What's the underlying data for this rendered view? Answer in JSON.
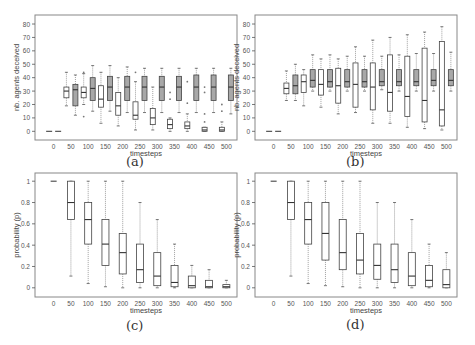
{
  "figure": {
    "panel_labels": [
      "(a)",
      "(b)",
      "(c)",
      "(d)"
    ]
  },
  "chart_data": [
    {
      "id": "a",
      "type": "boxplot",
      "panel_label": "(a)",
      "title": "",
      "xlabel": "timesteps",
      "ylabel": "nb. agents deceived",
      "categories": [
        "0",
        "50",
        "100",
        "150",
        "200",
        "250",
        "300",
        "350",
        "400",
        "450",
        "500"
      ],
      "yticks": [
        0,
        10,
        20,
        30,
        40,
        50,
        60,
        70,
        80
      ],
      "ytick_labels": [
        "0",
        "10",
        "20",
        "30",
        "40",
        "50",
        "60",
        "70",
        "80"
      ],
      "ylim": [
        -2,
        83
      ],
      "grid": false,
      "series": [
        {
          "name": "white",
          "fill": "#ffffff",
          "boxes": [
            {
              "min": 0,
              "q1": 0,
              "median": 0,
              "q3": 0,
              "max": 0,
              "outliers": []
            },
            {
              "min": 19,
              "q1": 25,
              "median": 30,
              "q3": 33,
              "max": 44,
              "outliers": []
            },
            {
              "min": 20,
              "q1": 25,
              "median": 29,
              "q3": 33,
              "max": 43,
              "outliers": [
                11,
                44
              ]
            },
            {
              "min": 6,
              "q1": 18,
              "median": 24,
              "q3": 34,
              "max": 44,
              "outliers": []
            },
            {
              "min": 4,
              "q1": 12,
              "median": 19,
              "q3": 29,
              "max": 40,
              "outliers": []
            },
            {
              "min": 1,
              "q1": 9,
              "median": 12,
              "q3": 22,
              "max": 37,
              "outliers": [
                44
              ]
            },
            {
              "min": 1,
              "q1": 5,
              "median": 10,
              "q3": 17,
              "max": 33,
              "outliers": []
            },
            {
              "min": 0,
              "q1": 2,
              "median": 5,
              "q3": 9,
              "max": 10,
              "outliers": [
                24,
                29
              ]
            },
            {
              "min": 0,
              "q1": 2,
              "median": 4,
              "q3": 7,
              "max": 13,
              "outliers": [
                21,
                37
              ]
            },
            {
              "min": 0,
              "q1": 0,
              "median": 1,
              "q3": 3,
              "max": 3,
              "outliers": [
                7,
                13,
                29,
                33
              ]
            },
            {
              "min": 0,
              "q1": 0,
              "median": 1,
              "q3": 3,
              "max": 7,
              "outliers": [
                15,
                20
              ]
            }
          ]
        },
        {
          "name": "grey",
          "fill": "#a8a8a8",
          "boxes": [
            {
              "min": 0,
              "q1": 0,
              "median": 0,
              "q3": 0,
              "max": 0,
              "outliers": []
            },
            {
              "min": 12,
              "q1": 19,
              "median": 31,
              "q3": 35,
              "max": 42,
              "outliers": []
            },
            {
              "min": 15,
              "q1": 23,
              "median": 32,
              "q3": 40,
              "max": 49,
              "outliers": []
            },
            {
              "min": 15,
              "q1": 23,
              "median": 33,
              "q3": 41,
              "max": 49,
              "outliers": []
            },
            {
              "min": 14,
              "q1": 23,
              "median": 33,
              "q3": 41,
              "max": 48,
              "outliers": []
            },
            {
              "min": 14,
              "q1": 23,
              "median": 33,
              "q3": 41,
              "max": 47,
              "outliers": []
            },
            {
              "min": 14,
              "q1": 23,
              "median": 33,
              "q3": 41,
              "max": 47,
              "outliers": []
            },
            {
              "min": 14,
              "q1": 23,
              "median": 33,
              "q3": 41,
              "max": 47,
              "outliers": []
            },
            {
              "min": 14,
              "q1": 23,
              "median": 33,
              "q3": 42,
              "max": 47,
              "outliers": []
            },
            {
              "min": 14,
              "q1": 23,
              "median": 33,
              "q3": 42,
              "max": 47,
              "outliers": []
            },
            {
              "min": 13,
              "q1": 23,
              "median": 33,
              "q3": 42,
              "max": 47,
              "outliers": []
            }
          ]
        }
      ],
      "frame": {
        "x0": 35,
        "y0": 15,
        "x1": 237,
        "y1": 140
      }
    },
    {
      "id": "b",
      "type": "boxplot",
      "panel_label": "(b)",
      "title": "",
      "xlabel": "timesteps",
      "ylabel": "nb. agents deceived",
      "categories": [
        "0",
        "50",
        "100",
        "150",
        "200",
        "250",
        "300",
        "350",
        "400",
        "450",
        "500"
      ],
      "yticks": [
        0,
        10,
        20,
        30,
        40,
        50,
        60,
        70,
        80
      ],
      "ytick_labels": [
        "0",
        "10",
        "20",
        "30",
        "40",
        "50",
        "60",
        "70",
        "80"
      ],
      "ylim": [
        -2,
        83
      ],
      "grid": false,
      "series": [
        {
          "name": "white",
          "fill": "#ffffff",
          "boxes": [
            {
              "min": 0,
              "q1": 0,
              "median": 0,
              "q3": 0,
              "max": 0,
              "outliers": []
            },
            {
              "min": 23,
              "q1": 28,
              "median": 32,
              "q3": 36,
              "max": 45,
              "outliers": []
            },
            {
              "min": 19,
              "q1": 29,
              "median": 37,
              "q3": 42,
              "max": 46,
              "outliers": []
            },
            {
              "min": 18,
              "q1": 27,
              "median": 35,
              "q3": 46,
              "max": 54,
              "outliers": []
            },
            {
              "min": 13,
              "q1": 21,
              "median": 34,
              "q3": 47,
              "max": 54,
              "outliers": []
            },
            {
              "min": 14,
              "q1": 18,
              "median": 35,
              "q3": 51,
              "max": 63,
              "outliers": []
            },
            {
              "min": 6,
              "q1": 16,
              "median": 33,
              "q3": 51,
              "max": 68,
              "outliers": []
            },
            {
              "min": 6,
              "q1": 15,
              "median": 29,
              "q3": 57,
              "max": 70,
              "outliers": []
            },
            {
              "min": 3,
              "q1": 11,
              "median": 26,
              "q3": 56,
              "max": 72,
              "outliers": []
            },
            {
              "min": 2,
              "q1": 7,
              "median": 23,
              "q3": 62,
              "max": 74,
              "outliers": []
            },
            {
              "min": 1,
              "q1": 4,
              "median": 16,
              "q3": 67,
              "max": 78,
              "outliers": []
            }
          ]
        },
        {
          "name": "grey",
          "fill": "#a8a8a8",
          "boxes": [
            {
              "min": 0,
              "q1": 0,
              "median": 0,
              "q3": 0,
              "max": 0,
              "outliers": []
            },
            {
              "min": 23,
              "q1": 28,
              "median": 34,
              "q3": 42,
              "max": 50,
              "outliers": []
            },
            {
              "min": 30,
              "q1": 33,
              "median": 38,
              "q3": 46,
              "max": 57,
              "outliers": []
            },
            {
              "min": 30,
              "q1": 33,
              "median": 37,
              "q3": 46,
              "max": 57,
              "outliers": []
            },
            {
              "min": 30,
              "q1": 33,
              "median": 37,
              "q3": 46,
              "max": 56,
              "outliers": []
            },
            {
              "min": 30,
              "q1": 33,
              "median": 37,
              "q3": 46,
              "max": 56,
              "outliers": []
            },
            {
              "min": 31,
              "q1": 34,
              "median": 37,
              "q3": 46,
              "max": 56,
              "outliers": []
            },
            {
              "min": 30,
              "q1": 34,
              "median": 37,
              "q3": 46,
              "max": 57,
              "outliers": []
            },
            {
              "min": 30,
              "q1": 34,
              "median": 37,
              "q3": 46,
              "max": 58,
              "outliers": []
            },
            {
              "min": 30,
              "q1": 34,
              "median": 38,
              "q3": 46,
              "max": 58,
              "outliers": []
            },
            {
              "min": 30,
              "q1": 34,
              "median": 38,
              "q3": 46,
              "max": 59,
              "outliers": []
            }
          ]
        }
      ],
      "frame": {
        "x0": 255,
        "y0": 15,
        "x1": 457,
        "y1": 140
      }
    },
    {
      "id": "c",
      "type": "boxplot",
      "panel_label": "(c)",
      "title": "",
      "xlabel": "timesteps",
      "ylabel": "probability (p)",
      "categories": [
        "0",
        "50",
        "100",
        "150",
        "200",
        "250",
        "300",
        "350",
        "400",
        "450",
        "500"
      ],
      "yticks": [
        0,
        0.2,
        0.4,
        0.6,
        0.8,
        1
      ],
      "ytick_labels": [
        "0",
        "0.2",
        "0.4",
        "0.6",
        "0.8",
        "1"
      ],
      "ylim": [
        -0.03,
        1.03
      ],
      "grid": false,
      "series": [
        {
          "name": "white",
          "fill": "#ffffff",
          "boxes": [
            {
              "min": 1,
              "q1": 1,
              "median": 1,
              "q3": 1,
              "max": 1,
              "outliers": []
            },
            {
              "min": 0.11,
              "q1": 0.64,
              "median": 0.8,
              "q3": 1,
              "max": 1,
              "outliers": []
            },
            {
              "min": 0.04,
              "q1": 0.41,
              "median": 0.64,
              "q3": 0.8,
              "max": 1,
              "outliers": []
            },
            {
              "min": 0.01,
              "q1": 0.21,
              "median": 0.41,
              "q3": 0.64,
              "max": 1,
              "outliers": []
            },
            {
              "min": 0,
              "q1": 0.13,
              "median": 0.33,
              "q3": 0.51,
              "max": 1,
              "outliers": []
            },
            {
              "min": 0,
              "q1": 0.05,
              "median": 0.17,
              "q3": 0.41,
              "max": 0.8,
              "outliers": []
            },
            {
              "min": 0,
              "q1": 0.02,
              "median": 0.11,
              "q3": 0.33,
              "max": 0.64,
              "outliers": []
            },
            {
              "min": 0,
              "q1": 0.01,
              "median": 0.05,
              "q3": 0.21,
              "max": 0.41,
              "outliers": []
            },
            {
              "min": 0,
              "q1": 0,
              "median": 0.02,
              "q3": 0.11,
              "max": 0.21,
              "outliers": []
            },
            {
              "min": 0,
              "q1": 0,
              "median": 0.01,
              "q3": 0.07,
              "max": 0.17,
              "outliers": []
            },
            {
              "min": 0,
              "q1": 0,
              "median": 0.01,
              "q3": 0.03,
              "max": 0.07,
              "outliers": []
            }
          ]
        }
      ],
      "frame": {
        "x0": 35,
        "y0": 173,
        "x1": 237,
        "y1": 297
      }
    },
    {
      "id": "d",
      "type": "boxplot",
      "panel_label": "(d)",
      "title": "",
      "xlabel": "timesteps",
      "ylabel": "probability (p)",
      "categories": [
        "0",
        "50",
        "100",
        "150",
        "200",
        "250",
        "300",
        "350",
        "400",
        "450",
        "500"
      ],
      "yticks": [
        0,
        0.2,
        0.4,
        0.6,
        0.8,
        1
      ],
      "ytick_labels": [
        "0",
        "0.2",
        "0.4",
        "0.6",
        "0.8",
        "1"
      ],
      "ylim": [
        -0.03,
        1.03
      ],
      "grid": false,
      "series": [
        {
          "name": "white",
          "fill": "#ffffff",
          "boxes": [
            {
              "min": 1,
              "q1": 1,
              "median": 1,
              "q3": 1,
              "max": 1,
              "outliers": []
            },
            {
              "min": 0.11,
              "q1": 0.64,
              "median": 0.8,
              "q3": 1,
              "max": 1,
              "outliers": []
            },
            {
              "min": 0.04,
              "q1": 0.41,
              "median": 0.64,
              "q3": 0.8,
              "max": 1,
              "outliers": []
            },
            {
              "min": 0.02,
              "q1": 0.26,
              "median": 0.51,
              "q3": 0.8,
              "max": 1,
              "outliers": []
            },
            {
              "min": 0.01,
              "q1": 0.17,
              "median": 0.33,
              "q3": 0.64,
              "max": 1,
              "outliers": []
            },
            {
              "min": 0,
              "q1": 0.13,
              "median": 0.26,
              "q3": 0.51,
              "max": 1,
              "outliers": []
            },
            {
              "min": 0,
              "q1": 0.08,
              "median": 0.21,
              "q3": 0.41,
              "max": 0.8,
              "outliers": []
            },
            {
              "min": 0,
              "q1": 0.05,
              "median": 0.17,
              "q3": 0.41,
              "max": 0.8,
              "outliers": []
            },
            {
              "min": 0,
              "q1": 0.02,
              "median": 0.11,
              "q3": 0.33,
              "max": 0.64,
              "outliers": []
            },
            {
              "min": 0,
              "q1": 0.01,
              "median": 0.07,
              "q3": 0.21,
              "max": 0.41,
              "outliers": []
            },
            {
              "min": 0,
              "q1": 0,
              "median": 0.03,
              "q3": 0.17,
              "max": 0.33,
              "outliers": []
            }
          ]
        }
      ],
      "frame": {
        "x0": 255,
        "y0": 173,
        "x1": 457,
        "y1": 297
      }
    }
  ]
}
